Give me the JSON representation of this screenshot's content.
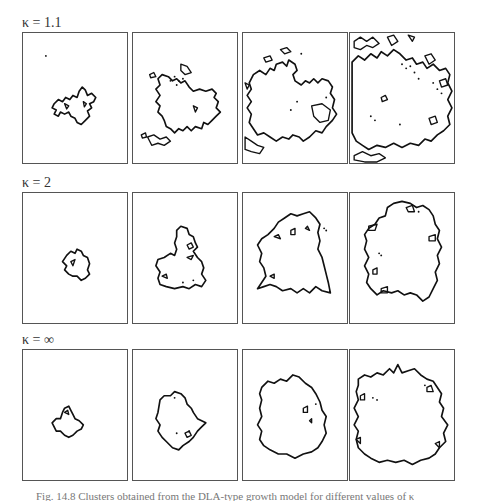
{
  "figure": {
    "rows": [
      {
        "label": "κ = 1.1",
        "label_top": 16,
        "panel_top": 32,
        "panels": [
          {
            "step": 1,
            "paths": [
              "M30 68 L34 64 L38 66 L41 62 L45 64 L48 60 L52 62 L54 56 L57 52 L60 55 L62 60 L66 58 L70 62 L68 66 L64 68 L66 72 L62 75 L64 80 L60 84 L56 88 L52 86 L50 82 L46 80 L44 76 L40 78 L36 76 L34 80 L30 78 L32 74 L28 72 Z",
              "M40 68 L44 70 L42 73 Z",
              "M58 66 L61 68 L59 71 Z"
            ],
            "dots": [
              [
                22,
                22
              ]
            ]
          },
          {
            "step": 2,
            "paths": [
              "M24 44 L28 40 L34 42 L38 46 L42 44 L46 48 L50 46 L54 52 L58 56 L64 54 L70 56 L76 54 L80 58 L78 62 L82 66 L80 72 L84 76 L80 80 L76 84 L72 88 L68 86 L66 92 L60 90 L56 94 L52 90 L48 94 L44 92 L40 96 L36 92 L32 90 L30 84 L28 80 L24 76 L26 70 L22 66 L26 60 L22 54 L26 50 Z",
              "M14 100 L20 98 L26 102 L32 100 L36 104 L30 108 L24 106 L18 108 Z",
              "M8 98 L12 96 L13 100 L9 101 Z",
              "M16 40 L20 38 L22 42 L17 43 Z",
              "M46 30 L52 32 L56 38 L50 40 L46 36 Z",
              "M58 70 L62 72 L60 76 Z"
            ],
            "dots": [
              [
                40,
                42
              ],
              [
                44,
                46
              ],
              [
                48,
                44
              ],
              [
                42,
                50
              ],
              [
                36,
                46
              ]
            ]
          },
          {
            "step": 3,
            "paths": [
              "M10 40 L16 36 L22 40 L26 34 L30 36 L32 30 L38 28 L42 32 L44 26 L50 30 L52 36 L48 40 L50 46 L56 50 L60 46 L64 48 L68 44 L72 48 L76 44 L82 46 L86 52 L84 58 L88 64 L86 72 L90 78 L86 84 L80 90 L76 96 L70 94 L64 100 L58 104 L54 100 L48 98 L44 102 L38 100 L32 104 L26 100 L20 96 L14 98 L10 92 L6 86 L8 78 L4 72 L8 66 L4 60 L8 54 L6 48 Z",
              "M2 100 L8 104 L14 108 L20 110 L16 116 L8 114 L2 112 Z",
              "M20 24 L26 22 L28 26 L22 28 Z",
              "M36 16 L42 14 L46 18 L40 20 Z",
              "M66 70 L76 68 L84 74 L82 84 L74 86 L68 80 Z",
              "M2 48 L6 50 L4 54 Z"
            ],
            "dots": [
              [
                56,
                20
              ],
              [
                80,
                62
              ],
              [
                52,
                66
              ],
              [
                46,
                74
              ]
            ]
          },
          {
            "step": 4,
            "paths": [
              "M2 28 L8 22 L14 26 L20 20 L26 24 L30 18 L36 22 L42 16 L48 20 L54 26 L60 24 L64 30 L70 28 L74 34 L80 30 L86 36 L92 34 L96 40 L94 48 L98 56 L94 64 L98 72 L94 80 L96 88 L90 94 L84 98 L78 104 L72 102 L66 108 L58 106 L50 110 L42 106 L34 110 L26 108 L18 112 L12 108 L6 104 L2 96 Z",
              "M4 8 L10 4 L16 8 L22 4 L28 10 L22 14 L16 12 L10 16 L4 14 Z",
              "M36 4 L42 2 L46 8 L40 12 Z",
              "M56 2 L62 4 L60 8 Z",
              "M72 22 L78 20 L82 26 L76 30 Z",
              "M4 118 L12 114 L20 118 L28 116 L34 120 L26 124 L14 124 L4 122 Z",
              "M30 62 L34 60 L36 64 L31 66 Z",
              "M86 46 L92 44 L94 50 L88 52 Z",
              "M76 82 L82 80 L84 86 L78 88 Z"
            ],
            "dots": [
              [
                50,
                30
              ],
              [
                54,
                34
              ],
              [
                58,
                32
              ],
              [
                62,
                38
              ],
              [
                66,
                44
              ],
              [
                80,
                48
              ],
              [
                84,
                54
              ],
              [
                88,
                58
              ],
              [
                20,
                80
              ],
              [
                24,
                84
              ],
              [
                48,
                88
              ]
            ]
          }
        ]
      },
      {
        "label": "κ = 2",
        "label_top": 176,
        "panel_top": 192,
        "panels": [
          {
            "step": 1,
            "paths": [
              "M42 60 L46 56 L50 58 L52 54 L56 56 L58 60 L62 62 L64 68 L62 74 L64 78 L60 82 L56 84 L52 80 L48 80 L44 78 L40 74 L42 70 L38 66 Z",
              "M46 66 L50 64 L48 70 Z"
            ],
            "dots": []
          },
          {
            "step": 2,
            "paths": [
              "M42 36 L46 32 L52 34 L54 40 L58 42 L60 48 L62 52 L58 56 L62 62 L66 66 L68 72 L66 78 L70 84 L66 90 L60 88 L54 92 L48 90 L40 92 L32 90 L26 88 L24 82 L26 76 L22 70 L24 64 L30 62 L36 58 L40 60 L42 54 L40 48 L42 42 Z",
              "M28 80 L32 78 L33 82 Z",
              "M52 62 L58 60 L56 64 Z",
              "M52 50 L56 48 L58 52 L54 54 Z"
            ],
            "dots": [
              [
                48,
                86
              ],
              [
                58,
                84
              ]
            ]
          },
          {
            "step": 3,
            "paths": [
              "M24 40 L30 34 L34 28 L40 24 L46 20 L52 22 L58 20 L64 18 L70 24 L74 30 L72 38 L74 46 L72 54 L76 62 L78 70 L80 78 L82 86 L84 96 L76 94 L70 90 L64 96 L58 92 L52 96 L46 92 L38 94 L32 90 L26 88 L20 90 L14 92 L18 86 L22 80 L20 72 L16 66 L18 58 L14 50 L18 44 Z",
              "M30 42 L34 40 L36 44 Z",
              "M46 36 L50 34 L50 40 L46 40 Z",
              "M60 34 L62 32 L64 36 Z",
              "M26 80 L30 78 L30 82 Z"
            ],
            "dots": [
              [
                78,
                34
              ],
              [
                80,
                36
              ]
            ]
          },
          {
            "step": 4,
            "paths": [
              "M14 40 L18 34 L24 30 L28 24 L34 22 L36 14 L42 10 L50 8 L58 10 L64 14 L70 12 L76 16 L80 22 L82 30 L86 36 L84 44 L88 52 L84 60 L86 68 L82 76 L84 84 L80 92 L76 100 L70 104 L64 98 L58 96 L52 98 L46 94 L40 96 L32 94 L26 98 L20 92 L16 86 L18 78 L14 70 L18 62 L14 54 L16 46 Z",
              "M18 32 L26 30 L24 36 L18 36 Z",
              "M54 14 L60 12 L62 18 L56 18 Z",
              "M76 42 L82 40 L82 46 L76 46 Z",
              "M22 74 L26 72 L26 78 L22 78 Z",
              "M30 92 L36 90 L36 96 L30 96 Z"
            ],
            "dots": [
              [
                28,
                58
              ],
              [
                30,
                60
              ],
              [
                66,
                18
              ]
            ]
          }
        ]
      },
      {
        "label": "κ = ∞",
        "label_top": 333,
        "panel_top": 349,
        "panels": [
          {
            "step": 1,
            "paths": [
              "M28 70 L32 66 L36 66 L38 60 L40 56 L44 54 L46 58 L48 62 L50 66 L54 68 L58 72 L56 76 L52 78 L48 82 L44 84 L40 82 L36 78 L32 78 Z",
              "M40 60 L43 58 L44 62 Z"
            ],
            "dots": []
          },
          {
            "step": 2,
            "paths": [
              "M26 48 L30 44 L36 44 L40 40 L46 42 L50 46 L52 52 L56 56 L58 60 L62 66 L70 70 L66 74 L62 78 L58 84 L54 88 L48 92 L44 96 L38 94 L32 88 L28 84 L24 78 L26 72 L22 66 L24 60 Z",
              "M50 80 L54 78 L56 82 L52 84 Z"
            ],
            "dots": [
              [
                42,
                80
              ],
              [
                54,
                78
              ],
              [
                40,
                46
              ]
            ]
          },
          {
            "step": 3,
            "paths": [
              "M18 36 L24 30 L30 32 L36 28 L42 30 L48 24 L54 26 L60 32 L66 36 L70 42 L74 50 L76 58 L80 64 L78 72 L80 80 L76 88 L72 94 L66 98 L58 100 L50 104 L42 100 L34 100 L26 96 L20 92 L16 86 L18 78 L14 72 L18 64 L16 56 L18 48 L16 42 Z",
              "M58 56 L62 54 L62 60 L58 60 Z",
              "M64 68 L66 66 L66 70 Z"
            ],
            "dots": [
              [
                70,
                52
              ]
            ]
          },
          {
            "step": 4,
            "paths": [
              "M8 28 L14 24 L20 26 L26 22 L32 24 L38 18 L42 22 L46 14 L50 22 L56 20 L62 18 L68 24 L74 28 L80 30 L84 36 L88 42 L86 50 L90 56 L88 64 L94 72 L90 80 L92 88 L86 94 L82 100 L76 104 L68 106 L60 110 L52 106 L44 108 L36 106 L28 108 L20 104 L14 100 L8 94 L6 86 L8 78 L4 72 L8 64 L4 56 L8 48 L6 40 L8 34 Z",
              "M10 44 L14 42 L14 48 L10 48 Z",
              "M74 36 L78 34 L80 40 L74 40 Z",
              "M6 86 L10 84 L10 90 Z",
              "M82 90 L86 88 L86 94 Z"
            ],
            "dots": [
              [
                22,
                46
              ],
              [
                26,
                48
              ],
              [
                72,
                34
              ]
            ]
          }
        ]
      }
    ],
    "panel_left": [
      22,
      132,
      242,
      349
    ],
    "panel_width": 106,
    "panel_height": 132,
    "caption": "Fig. 14.8  Clusters obtained from the DLA-type growth model for different values of κ"
  }
}
